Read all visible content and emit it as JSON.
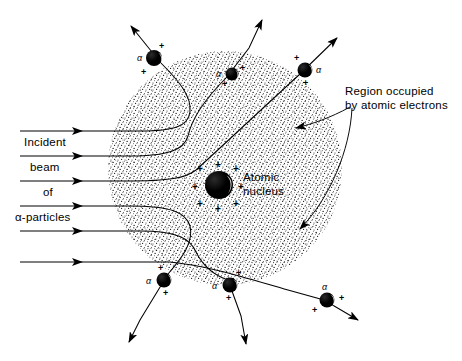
{
  "figure": {
    "type": "rutherford-scattering-diagram",
    "background": "#ffffff",
    "ink": "#000000"
  },
  "atom": {
    "region_fill": "stipple",
    "center": {
      "cx": 225,
      "cy": 168
    },
    "radius": 117
  },
  "nucleus": {
    "label_line1": "Atomic",
    "label_line2": "nucleus",
    "charge_symbol": "+",
    "charge_count": 8,
    "cx": 219,
    "cy": 185,
    "r": 14
  },
  "annotation": {
    "region_line1": "Region occupied",
    "region_line2": "by atomic electrons"
  },
  "beam": {
    "label_lines": [
      "Incident",
      "beam",
      "of",
      "α-particles"
    ],
    "ray_count": 6,
    "ray_start_x": 20,
    "arrow_x": 78
  },
  "alpha_particles": [
    {
      "id": "a1",
      "symbol": "α",
      "charge": "+",
      "cx": 154,
      "cy": 58,
      "r": 8,
      "label_side": "left"
    },
    {
      "id": "a2",
      "symbol": "α",
      "charge": "+",
      "cx": 232,
      "cy": 74,
      "r": 6.5,
      "label_side": "left"
    },
    {
      "id": "a3",
      "symbol": "α",
      "charge": "+",
      "cx": 305,
      "cy": 70,
      "r": 7.5,
      "label_side": "right"
    },
    {
      "id": "a4",
      "symbol": "α",
      "charge": "+",
      "cx": 164,
      "cy": 280,
      "r": 7.5,
      "label_side": "left"
    },
    {
      "id": "a5",
      "symbol": "α",
      "charge": "+",
      "cx": 230,
      "cy": 285,
      "r": 7.5,
      "label_side": "left"
    },
    {
      "id": "a6",
      "symbol": "α",
      "charge": "+",
      "cx": 327,
      "cy": 300,
      "r": 7.5,
      "label_side": "topleft"
    }
  ]
}
